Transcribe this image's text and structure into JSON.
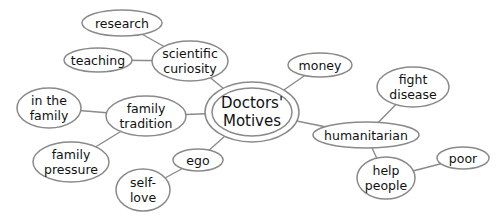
{
  "diagram": {
    "type": "concept-map",
    "center": {
      "id": "center",
      "lines": [
        "Doctors'",
        "Motives"
      ],
      "cx": 252,
      "cy": 112,
      "rx": 47,
      "ry": 30,
      "inner_rx": 40,
      "inner_ry": 24
    },
    "nodes": [
      {
        "id": "research",
        "lines": [
          "research"
        ],
        "cx": 122,
        "cy": 23,
        "rx": 40,
        "ry": 13
      },
      {
        "id": "teaching",
        "lines": [
          "teaching"
        ],
        "cx": 98,
        "cy": 60,
        "rx": 34,
        "ry": 12
      },
      {
        "id": "scientific-curiosity",
        "lines": [
          "scientific",
          "curiosity"
        ],
        "cx": 190,
        "cy": 61,
        "rx": 38,
        "ry": 20
      },
      {
        "id": "in-the-family",
        "lines": [
          "in the",
          "family"
        ],
        "cx": 49,
        "cy": 108,
        "rx": 32,
        "ry": 20
      },
      {
        "id": "family-tradition",
        "lines": [
          "family",
          "tradition"
        ],
        "cx": 146,
        "cy": 116,
        "rx": 40,
        "ry": 20
      },
      {
        "id": "family-pressure",
        "lines": [
          "family",
          "pressure"
        ],
        "cx": 71,
        "cy": 162,
        "rx": 38,
        "ry": 20
      },
      {
        "id": "money",
        "lines": [
          "money"
        ],
        "cx": 320,
        "cy": 65,
        "rx": 32,
        "ry": 12
      },
      {
        "id": "fight-disease",
        "lines": [
          "fight",
          "disease"
        ],
        "cx": 413,
        "cy": 87,
        "rx": 36,
        "ry": 20
      },
      {
        "id": "humanitarian",
        "lines": [
          "humanitarian"
        ],
        "cx": 366,
        "cy": 135,
        "rx": 53,
        "ry": 13
      },
      {
        "id": "ego",
        "lines": [
          "ego"
        ],
        "cx": 198,
        "cy": 160,
        "rx": 25,
        "ry": 11
      },
      {
        "id": "self-love",
        "lines": [
          "self-",
          "love"
        ],
        "cx": 143,
        "cy": 190,
        "rx": 27,
        "ry": 21
      },
      {
        "id": "help-people",
        "lines": [
          "help",
          "people"
        ],
        "cx": 386,
        "cy": 178,
        "rx": 29,
        "ry": 21
      },
      {
        "id": "poor",
        "lines": [
          "poor"
        ],
        "cx": 463,
        "cy": 158,
        "rx": 26,
        "ry": 11
      }
    ],
    "edges": [
      [
        "research",
        "scientific-curiosity"
      ],
      [
        "teaching",
        "scientific-curiosity"
      ],
      [
        "scientific-curiosity",
        "center"
      ],
      [
        "in-the-family",
        "family-tradition"
      ],
      [
        "family-tradition",
        "center"
      ],
      [
        "family-pressure",
        "family-tradition"
      ],
      [
        "money",
        "center"
      ],
      [
        "humanitarian",
        "center"
      ],
      [
        "fight-disease",
        "humanitarian"
      ],
      [
        "help-people",
        "humanitarian"
      ],
      [
        "poor",
        "help-people"
      ],
      [
        "ego",
        "center"
      ],
      [
        "self-love",
        "ego"
      ]
    ],
    "colors": {
      "stroke": "#8a8a8a",
      "text": "#111111",
      "background": "#ffffff"
    }
  }
}
